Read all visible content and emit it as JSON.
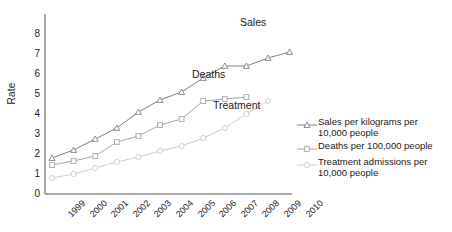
{
  "chart_data": {
    "type": "line",
    "title": "",
    "xlabel": "",
    "ylabel": "Rate",
    "ylim": [
      0,
      8
    ],
    "yticks": [
      0,
      1,
      2,
      3,
      4,
      5,
      6,
      7,
      8
    ],
    "grid": false,
    "legend_position": "right",
    "categories": [
      "1999",
      "2000",
      "2001",
      "2002",
      "2003",
      "2004",
      "2005",
      "2006",
      "2007",
      "2008",
      "2009",
      "2010"
    ],
    "series": [
      {
        "name": "Sales per kilograms per 10,000 people",
        "short_name": "Sales",
        "marker": "triangle",
        "color": "#808080",
        "values": [
          1.8,
          2.2,
          2.75,
          3.3,
          4.1,
          4.7,
          5.1,
          5.8,
          6.4,
          6.4,
          6.8,
          7.1
        ]
      },
      {
        "name": "Deaths per 100,000 people",
        "short_name": "Deaths",
        "marker": "square",
        "color": "#a6a6a6",
        "values": [
          1.45,
          1.65,
          1.9,
          2.6,
          2.9,
          3.45,
          3.75,
          4.65,
          4.75,
          4.85,
          null,
          null
        ]
      },
      {
        "name": "Treatment admissions per 10,000 people",
        "short_name": "Treatment",
        "marker": "circle",
        "color": "#cccccc",
        "values": [
          0.8,
          1.0,
          1.3,
          1.6,
          1.85,
          2.15,
          2.4,
          2.8,
          3.3,
          4.0,
          4.65,
          null
        ]
      }
    ],
    "annotations": [
      {
        "text": "Sales",
        "x_px": 240,
        "y_px": 16
      },
      {
        "text": "Deaths",
        "x_px": 192,
        "y_px": 68
      },
      {
        "text": "Treatment",
        "x_px": 213,
        "y_px": 99
      }
    ]
  },
  "legend": {
    "entries": [
      {
        "marker": "triangle",
        "label": "Sales per kilograms per\n10,000 people"
      },
      {
        "marker": "square",
        "label": "Deaths per 100,000 people"
      },
      {
        "marker": "circle",
        "label": "Treatment admissions per\n10,000 people"
      }
    ]
  },
  "axis": {
    "y_title": "Rate",
    "y_ticks": [
      "8",
      "7",
      "6",
      "5",
      "4",
      "3",
      "2",
      "1",
      "0"
    ],
    "x_ticks": [
      "1999",
      "2000",
      "2001",
      "2002",
      "2003",
      "2004",
      "2005",
      "2006",
      "2007",
      "2008",
      "2009",
      "2010"
    ]
  }
}
